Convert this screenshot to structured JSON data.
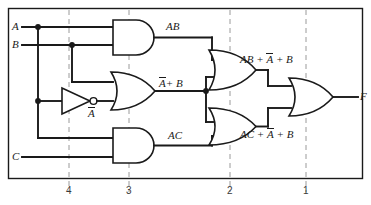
{
  "diagram": {
    "inputs": [
      {
        "name": "A",
        "label": "A",
        "y": 27
      },
      {
        "name": "B",
        "label": "B",
        "y": 45
      },
      {
        "name": "C",
        "label": "C",
        "y": 157
      }
    ],
    "output": {
      "name": "F",
      "label": "F",
      "y": 97
    },
    "signal_labels": {
      "and1": "AB",
      "not1_base": "A",
      "or1_a": "A",
      "or1_b": "B",
      "or1_plus": "+",
      "and2": "AC",
      "or2_p1": "AB",
      "or2_p2": "A",
      "or2_p3": "B",
      "or3_p1": "AC",
      "or3_p2": "A",
      "or3_p3": "B"
    },
    "levels": [
      {
        "label": "4",
        "x": 69
      },
      {
        "label": "3",
        "x": 129
      },
      {
        "label": "2",
        "x": 230
      },
      {
        "label": "1",
        "x": 306
      }
    ],
    "gates": [
      {
        "name": "and-gate-ab",
        "type": "AND",
        "level": 3
      },
      {
        "name": "not-gate-a",
        "type": "NOT",
        "level": 4
      },
      {
        "name": "or-gate-nota-b",
        "type": "OR",
        "level": 3
      },
      {
        "name": "and-gate-ac",
        "type": "AND",
        "level": 3
      },
      {
        "name": "or-gate-upper",
        "type": "OR",
        "level": 2
      },
      {
        "name": "or-gate-lower",
        "type": "OR",
        "level": 2
      },
      {
        "name": "or-gate-output",
        "type": "OR",
        "level": 1
      }
    ],
    "colors": {
      "wire": "#1a1a1a",
      "level_guide": "#9a9a9a",
      "background": "#ffffff"
    }
  }
}
